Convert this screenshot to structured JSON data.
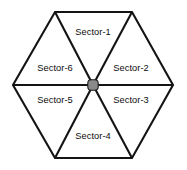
{
  "diagram": {
    "shape": "hexagon",
    "orientation": "flat-top",
    "background_color": "#ffffff",
    "line_color": "#141414",
    "hub": {
      "name": "center-hub",
      "color": "#8a8a8a",
      "outline_color": "#1a1a1a",
      "cx": 93,
      "cy": 85,
      "radius": 5.2
    },
    "vertices": [
      {
        "name": "top-left",
        "x": 55,
        "y": 12
      },
      {
        "name": "top-right",
        "x": 132,
        "y": 12
      },
      {
        "name": "right",
        "x": 173,
        "y": 85
      },
      {
        "name": "bottom-right",
        "x": 132,
        "y": 158
      },
      {
        "name": "bottom-left",
        "x": 55,
        "y": 158
      },
      {
        "name": "left",
        "x": 13,
        "y": 85
      }
    ],
    "sectors": [
      {
        "id": "sector-1",
        "label": "Sector-1",
        "position": "top",
        "label_x": 93,
        "label_y": 33
      },
      {
        "id": "sector-2",
        "label": "Sector-2",
        "position": "upper-right",
        "label_x": 131,
        "label_y": 69
      },
      {
        "id": "sector-3",
        "label": "Sector-3",
        "position": "lower-right",
        "label_x": 131,
        "label_y": 101
      },
      {
        "id": "sector-4",
        "label": "Sector-4",
        "position": "bottom",
        "label_x": 93,
        "label_y": 137
      },
      {
        "id": "sector-5",
        "label": "Sector-5",
        "position": "lower-left",
        "label_x": 55,
        "label_y": 101
      },
      {
        "id": "sector-6",
        "label": "Sector-6",
        "position": "upper-left",
        "label_x": 55,
        "label_y": 69
      }
    ]
  }
}
